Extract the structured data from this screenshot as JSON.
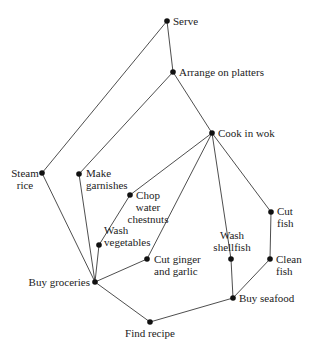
{
  "diagram": {
    "type": "task-precedence-graph",
    "style": {
      "edge_color": "#3a3a3a",
      "node_color": "#111111",
      "label_color": "#222222",
      "background": "#ffffff"
    },
    "nodes": [
      {
        "id": "serve",
        "label_lines": [
          "Serve"
        ],
        "x": 167,
        "y": 21,
        "anchor": "start",
        "lx": 173,
        "ly": 25
      },
      {
        "id": "arrange",
        "label_lines": [
          "Arrange on platters"
        ],
        "x": 173,
        "y": 72,
        "anchor": "start",
        "lx": 179,
        "ly": 76
      },
      {
        "id": "cook",
        "label_lines": [
          "Cook in wok"
        ],
        "x": 212,
        "y": 133,
        "anchor": "start",
        "lx": 218,
        "ly": 137
      },
      {
        "id": "steam",
        "label_lines": [
          "Steam",
          "rice"
        ],
        "x": 42,
        "y": 173,
        "anchor": "middle",
        "lx": 25,
        "ly": 177
      },
      {
        "id": "garnish",
        "label_lines": [
          "Make",
          "garnishes"
        ],
        "x": 79,
        "y": 174,
        "anchor": "start",
        "lx": 86,
        "ly": 177
      },
      {
        "id": "chop",
        "label_lines": [
          "Chop",
          "water",
          "chestnuts"
        ],
        "x": 130,
        "y": 195,
        "anchor": "middle",
        "lx": 148,
        "ly": 199
      },
      {
        "id": "cutfish",
        "label_lines": [
          "Cut",
          "fish"
        ],
        "x": 271,
        "y": 212,
        "anchor": "start",
        "lx": 277,
        "ly": 215
      },
      {
        "id": "washveg",
        "label_lines": [
          "Wash",
          "vegetables"
        ],
        "x": 99,
        "y": 245,
        "anchor": "start",
        "lx": 104,
        "ly": 234
      },
      {
        "id": "ginger",
        "label_lines": [
          "Cut ginger",
          "and garlic"
        ],
        "x": 147,
        "y": 259,
        "anchor": "start",
        "lx": 154,
        "ly": 263
      },
      {
        "id": "shellfish",
        "label_lines": [
          "Wash",
          "shellfish"
        ],
        "x": 231,
        "y": 259,
        "anchor": "middle",
        "lx": 232,
        "ly": 239
      },
      {
        "id": "cleanfish",
        "label_lines": [
          "Clean",
          "fish"
        ],
        "x": 270,
        "y": 259,
        "anchor": "start",
        "lx": 276,
        "ly": 263
      },
      {
        "id": "groceries",
        "label_lines": [
          "Buy groceries"
        ],
        "x": 95,
        "y": 282,
        "anchor": "end",
        "lx": 90,
        "ly": 286
      },
      {
        "id": "seafood",
        "label_lines": [
          "Buy seafood"
        ],
        "x": 233,
        "y": 298,
        "anchor": "start",
        "lx": 239,
        "ly": 302
      },
      {
        "id": "recipe",
        "label_lines": [
          "Find recipe"
        ],
        "x": 150,
        "y": 322,
        "anchor": "middle",
        "lx": 150,
        "ly": 337
      }
    ],
    "edges": [
      [
        "recipe",
        "groceries"
      ],
      [
        "recipe",
        "seafood"
      ],
      [
        "groceries",
        "steam"
      ],
      [
        "groceries",
        "garnish"
      ],
      [
        "groceries",
        "washveg"
      ],
      [
        "groceries",
        "ginger"
      ],
      [
        "washveg",
        "chop"
      ],
      [
        "seafood",
        "shellfish"
      ],
      [
        "seafood",
        "cleanfish"
      ],
      [
        "cleanfish",
        "cutfish"
      ],
      [
        "chop",
        "cook"
      ],
      [
        "ginger",
        "cook"
      ],
      [
        "shellfish",
        "cook"
      ],
      [
        "cutfish",
        "cook"
      ],
      [
        "cook",
        "arrange"
      ],
      [
        "garnish",
        "arrange"
      ],
      [
        "arrange",
        "serve"
      ],
      [
        "steam",
        "serve"
      ]
    ]
  }
}
